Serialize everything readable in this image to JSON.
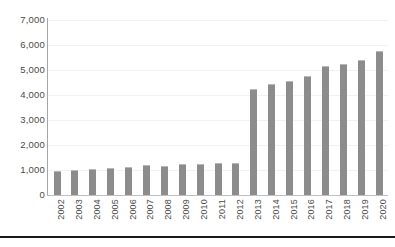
{
  "chart_data": {
    "type": "bar",
    "title": "",
    "subtitle": "",
    "xlabel": "",
    "ylabel": "",
    "categories": [
      "2002",
      "2003",
      "2004",
      "2005",
      "2006",
      "2007",
      "2008",
      "2009",
      "2010",
      "2011",
      "2012",
      "2013",
      "2014",
      "2015",
      "2016",
      "2017",
      "2018",
      "2019",
      "2020"
    ],
    "values": [
      950,
      1000,
      1040,
      1090,
      1130,
      1200,
      1180,
      1250,
      1240,
      1270,
      1290,
      4250,
      4450,
      4550,
      4750,
      5150,
      5250,
      5400,
      5750
    ],
    "series": [
      {
        "name": "",
        "values": [
          950,
          1000,
          1040,
          1090,
          1130,
          1200,
          1180,
          1250,
          1240,
          1270,
          1290,
          4250,
          4450,
          4550,
          4750,
          5150,
          5250,
          5400,
          5750
        ]
      }
    ],
    "ylim": [
      0,
      7000
    ],
    "ytick_values": [
      0,
      1000,
      2000,
      3000,
      4000,
      5000,
      6000,
      7000
    ],
    "ytick_labels": [
      "0",
      "1,000",
      "2,000",
      "3,000",
      "4,000",
      "5,000",
      "6,000",
      "7,000"
    ],
    "grid": true,
    "legend": false,
    "legend_position": "none",
    "bar_color": "#8c8c8c",
    "grid_color": "#f2f2f2",
    "axis_color": "#a6a6a6",
    "text_color": "#4a4a4a",
    "background": "#ffffff"
  }
}
